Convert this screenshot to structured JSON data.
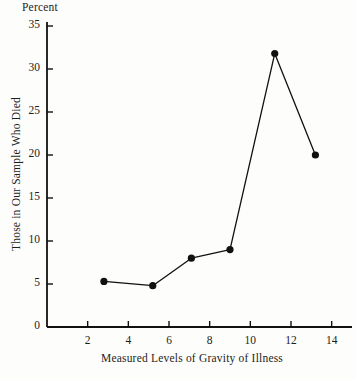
{
  "chart_data": {
    "type": "line",
    "title": "",
    "unit_label": "Percent",
    "xlabel": "Measured Levels of Gravity of Illness",
    "ylabel": "Those in Our Sample Who Died",
    "xlim": [
      0,
      15
    ],
    "ylim": [
      0,
      35
    ],
    "xticks": [
      2,
      4,
      6,
      8,
      10,
      12,
      14
    ],
    "yticks": [
      0,
      5,
      10,
      15,
      20,
      25,
      30,
      35
    ],
    "xtick_labels": [
      "2",
      "4",
      "6",
      "8",
      "10",
      "12",
      "14"
    ],
    "ytick_labels": [
      "0",
      "5",
      "10",
      "15",
      "20",
      "25",
      "30",
      "35"
    ],
    "grid": false,
    "legend": false,
    "marker": "filled-circle",
    "line_color": "#111111",
    "marker_color": "#111111",
    "background_color": "#fdfdfb",
    "x": [
      2.8,
      5.2,
      7.1,
      9.0,
      11.2,
      13.2
    ],
    "values": [
      5.3,
      4.8,
      8.0,
      9.0,
      31.8,
      20.0
    ],
    "series": [
      {
        "name": "Those in Our Sample Who Died",
        "x": [
          2.8,
          5.2,
          7.1,
          9.0,
          11.2,
          13.2
        ],
        "values": [
          5.3,
          4.8,
          8.0,
          9.0,
          31.8,
          20.0
        ]
      }
    ],
    "points": [
      {
        "x": 2.8,
        "y": 5.3
      },
      {
        "x": 5.2,
        "y": 4.8
      },
      {
        "x": 7.1,
        "y": 8.0
      },
      {
        "x": 9.0,
        "y": 9.0
      },
      {
        "x": 11.2,
        "y": 31.8
      },
      {
        "x": 13.2,
        "y": 20.0
      }
    ]
  }
}
